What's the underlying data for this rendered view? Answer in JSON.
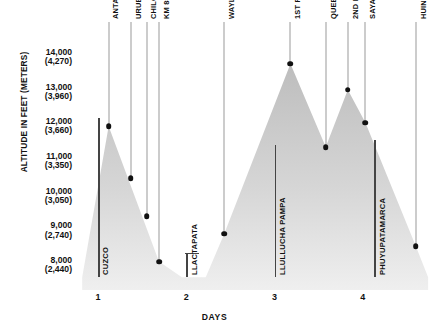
{
  "chart_data": {
    "type": "area",
    "title": "",
    "xlabel": "DAYS",
    "ylabel": "ALTITUDE IN FEET (METERS)",
    "ylim": [
      7500,
      14400
    ],
    "xlim": [
      0.75,
      4.75
    ],
    "grid": false,
    "legend": "none",
    "y_ticks": [
      {
        "feet": 14000,
        "meters": 4270,
        "label_feet": "14,000",
        "label_meters": "(4,270)"
      },
      {
        "feet": 13000,
        "meters": 3960,
        "label_feet": "13,000",
        "label_meters": "(3,960)"
      },
      {
        "feet": 12000,
        "meters": 3660,
        "label_feet": "12,000",
        "label_meters": "(3,660)"
      },
      {
        "feet": 11000,
        "meters": 3350,
        "label_feet": "11,000",
        "label_meters": "(3,350)"
      },
      {
        "feet": 10000,
        "meters": 3050,
        "label_feet": "10,000",
        "label_meters": "(3,050)"
      },
      {
        "feet": 9000,
        "meters": 2740,
        "label_feet": "9,000",
        "label_meters": "(2,740)"
      },
      {
        "feet": 8000,
        "meters": 2440,
        "label_feet": "8,000",
        "label_meters": "(2,440)"
      }
    ],
    "x_ticks": [
      {
        "value": 1,
        "label": "1"
      },
      {
        "value": 2,
        "label": "2"
      },
      {
        "value": 3,
        "label": "3"
      },
      {
        "value": 4,
        "label": "4"
      }
    ],
    "points": [
      {
        "name": "Anta Plateau",
        "label": "ANTA PLATEAU",
        "x": 1.12,
        "feet": 12000
      },
      {
        "name": "Urubamba Valley",
        "label": "URUBAMBA VALLEY",
        "x": 1.37,
        "feet": 10500
      },
      {
        "name": "Chilca",
        "label": "CHILCA",
        "x": 1.55,
        "feet": 9400
      },
      {
        "name": "Km 88",
        "label": "KM 88",
        "x": 1.69,
        "feet": 8100
      },
      {
        "name": "Wayllabamba",
        "label": "WAYLLABAMBA",
        "x": 2.43,
        "feet": 8900
      },
      {
        "name": "1st Pass",
        "label": "1ST PASS",
        "x": 3.18,
        "feet": 13800
      },
      {
        "name": "Quebrada Pacamayo",
        "label": "QUEBRADA PACAMAYO",
        "x": 3.58,
        "feet": 11400
      },
      {
        "name": "2nd Pass",
        "label": "2ND PASS",
        "x": 3.83,
        "feet": 13050
      },
      {
        "name": "Sayajmarca",
        "label": "SAYAJMARCA",
        "x": 4.03,
        "feet": 12100
      },
      {
        "name": "Huinay Huayna",
        "label": "HUINAY HUAYNA",
        "x": 4.6,
        "feet": 8550
      }
    ],
    "sites": [
      {
        "name": "Cuzco",
        "label": "CUZCO",
        "x": 1.0,
        "top_feet": 12250,
        "bottom_feet": 7650,
        "cap": false
      },
      {
        "name": "Llactapata",
        "label": "LLACTAPATA",
        "x": 2.0,
        "top_feet": 8350,
        "bottom_feet": 7650,
        "cap": true
      },
      {
        "name": "Llullucha Pampa",
        "label": "LLULLUCHA PAMPA",
        "x": 3.0,
        "top_feet": 11450,
        "bottom_feet": 7650,
        "cap": false
      },
      {
        "name": "Phuyupatamarca",
        "label": "PHUYUPATAMARCA",
        "x": 4.13,
        "top_feet": 11600,
        "bottom_feet": 7650,
        "cap": false
      }
    ],
    "terrain_profile": [
      {
        "x": 0.82,
        "feet": 7650
      },
      {
        "x": 1.12,
        "feet": 12000
      },
      {
        "x": 1.69,
        "feet": 8100
      },
      {
        "x": 1.95,
        "feet": 7650
      },
      {
        "x": 2.22,
        "feet": 7650
      },
      {
        "x": 2.43,
        "feet": 8900
      },
      {
        "x": 3.18,
        "feet": 13800
      },
      {
        "x": 3.58,
        "feet": 11400
      },
      {
        "x": 3.83,
        "feet": 13050
      },
      {
        "x": 4.03,
        "feet": 12100
      },
      {
        "x": 4.6,
        "feet": 8550
      },
      {
        "x": 4.74,
        "feet": 7650
      }
    ],
    "colors": {
      "terrain_fill": "#c9c9c9",
      "terrain_fill_light": "#e8e8e8",
      "marker": "#111111",
      "leader_line": "#9a9a9a",
      "site_bar": "#444444",
      "text": "#111111",
      "background": "#ffffff"
    }
  }
}
